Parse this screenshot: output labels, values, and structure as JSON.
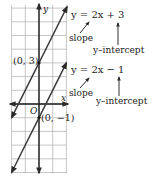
{
  "chart_data": {
    "type": "line",
    "title": "",
    "xlabel": "x",
    "ylabel": "y",
    "origin_label": "O",
    "xlim": [
      -2,
      2
    ],
    "ylim": [
      -5,
      7
    ],
    "grid": true,
    "series": [
      {
        "name": "y = 2x + 3",
        "slope": 2,
        "intercept": 3,
        "points": [
          [
            -2,
            -1
          ],
          [
            2.05,
            7.1
          ]
        ],
        "labeled_point": {
          "x": 0,
          "y": 3,
          "label": "(0, 3)"
        }
      },
      {
        "name": "y = 2x − 1",
        "slope": 2,
        "intercept": -1,
        "points": [
          [
            -2,
            -5
          ],
          [
            2,
            3
          ]
        ],
        "labeled_point": {
          "x": 0,
          "y": -1,
          "label": "(0, −1)"
        }
      }
    ],
    "annotations": [
      {
        "equation": "y = 2x + 3",
        "slope_label": "slope",
        "intercept_label": "y–intercept"
      },
      {
        "equation": "y = 2x − 1",
        "slope_label": "slope",
        "intercept_label": "y–intercept"
      }
    ]
  },
  "labels": {
    "eq1": "y = 2x + 3",
    "eq2": "y = 2x − 1",
    "slope": "slope",
    "intercept": "y–intercept",
    "pt1": "(0, 3)",
    "pt2": "(0, −1)",
    "x_axis": "x",
    "y_axis": "y",
    "origin": "O"
  },
  "colors": {
    "grid": "#b8b8b8",
    "axis": "#1a1a1a",
    "line": "#3a3a3a",
    "text": "#1a1a1a"
  }
}
